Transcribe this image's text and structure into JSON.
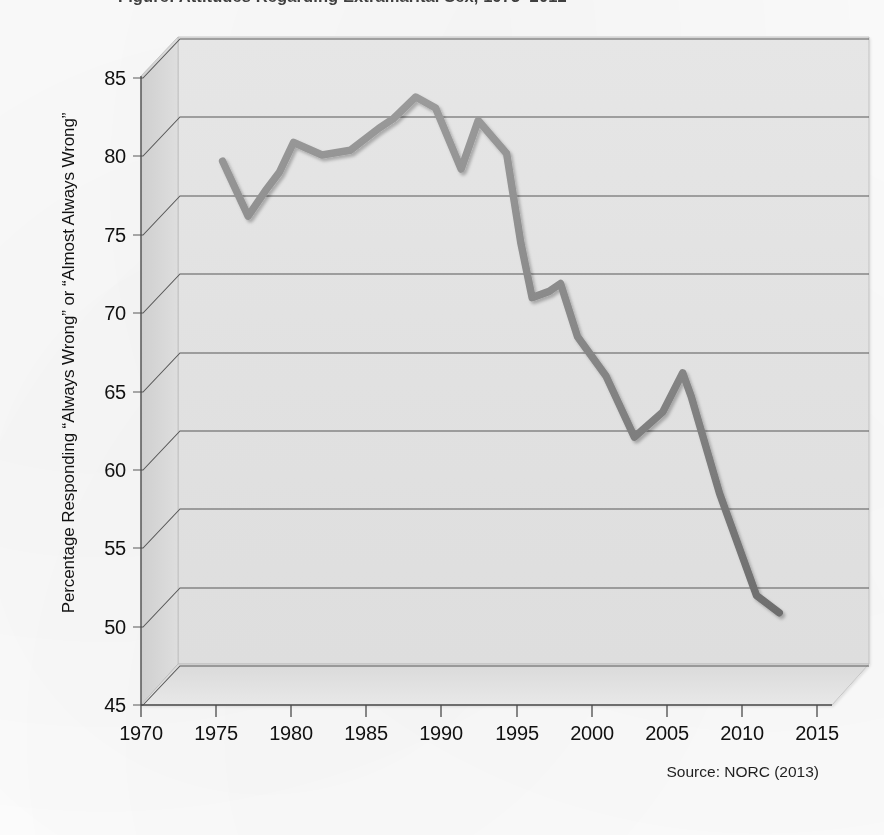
{
  "title": "Figure: Attitudes Regarding Extramarital Sex, 1973–2012",
  "y_axis_title": "Percentage Responding “Always Wrong” or “Almost Always Wrong”",
  "source_note": "Source: NORC (2013)",
  "colors": {
    "line": "#8c8c8c",
    "line_shade": "#6f6f6f",
    "panel_back": "#e3e3e3",
    "panel_floor": "#dcdcdc",
    "panel_side": "#cfcfcf",
    "gridline": "#555555",
    "axis": "#4d4d4d",
    "text": "#111111"
  },
  "y_ticks": [
    45,
    50,
    55,
    60,
    65,
    70,
    75,
    80,
    85
  ],
  "x_ticks": [
    1970,
    1975,
    1980,
    1985,
    1990,
    1995,
    2000,
    2005,
    2010,
    2015
  ],
  "chart_data": {
    "type": "line",
    "title": "Attitudes Regarding Extramarital Sex",
    "subtitle": "",
    "xlabel": "",
    "ylabel": "Percentage Responding “Always Wrong” or “Almost Always Wrong”",
    "xlim": [
      1970,
      2015
    ],
    "ylim": [
      45,
      85
    ],
    "grid": true,
    "legend": false,
    "source": "Source: NORC (2013)",
    "series": [
      {
        "name": "Percentage Responding “Always Wrong” or “Almost Always Wrong”",
        "color": "#8c8c8c",
        "x": [
          1973,
          1974.8,
          1976,
          1977,
          1978,
          1980,
          1982,
          1984,
          1985,
          1986.6,
          1988,
          1989.8,
          1991,
          1993,
          1994,
          1994.8,
          1996,
          1996.8,
          1998,
          2000,
          2002,
          2004,
          2005.4,
          2006,
          2008,
          2010.6,
          2012.2
        ],
        "y": [
          77.2,
          73.7,
          75.3,
          76.5,
          78.4,
          77.6,
          77.9,
          79.3,
          79.9,
          81.3,
          80.6,
          76.7,
          79.8,
          77.7,
          72.0,
          68.5,
          68.9,
          69.4,
          66.0,
          63.5,
          59.6,
          61.2,
          63.7,
          62.2,
          56.0,
          49.5,
          48.4
        ]
      }
    ]
  }
}
